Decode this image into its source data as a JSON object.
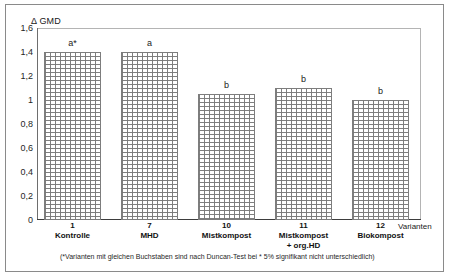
{
  "chart_data": {
    "type": "bar",
    "title": "",
    "ylabel": "Δ GMD",
    "xlabel": "Varianten",
    "ylim": [
      0,
      1.6
    ],
    "grid": false,
    "legend": "none",
    "ytick_labels": [
      "1,6",
      "1,4",
      "1,2",
      "1",
      "0,8",
      "0,6",
      "0,4",
      "0,2",
      "0"
    ],
    "ytick_values": [
      1.6,
      1.4,
      1.2,
      1.0,
      0.8,
      0.6,
      0.4,
      0.2,
      0
    ],
    "categories": [
      "Kontrolle",
      "MHD",
      "Mistkompost",
      "Mistkompost + org.HD",
      "Biokompost"
    ],
    "variant_numbers": [
      "1",
      "7",
      "10",
      "11",
      "12"
    ],
    "values": [
      1.4,
      1.4,
      1.05,
      1.1,
      1.0
    ],
    "annotations": [
      "a*",
      "a",
      "b",
      "b",
      "b"
    ],
    "bars": [
      {
        "number": "1",
        "name_line1": "Kontrolle",
        "name_line2": "",
        "value": 1.4,
        "letter": "a*"
      },
      {
        "number": "7",
        "name_line1": "MHD",
        "name_line2": "",
        "value": 1.4,
        "letter": "a"
      },
      {
        "number": "10",
        "name_line1": "Mistkompost",
        "name_line2": "",
        "value": 1.05,
        "letter": "b"
      },
      {
        "number": "11",
        "name_line1": "Mistkompost",
        "name_line2": "+ org.HD",
        "value": 1.1,
        "letter": "b"
      },
      {
        "number": "12",
        "name_line1": "Biokompost",
        "name_line2": "",
        "value": 1.0,
        "letter": "b"
      }
    ],
    "footnote": "(*Varianten mit gleichen Buchstaben sind nach Duncan-Test bei * 5% signifikant nicht unterschiedlich)",
    "colors": {
      "bar_fill": "#ffffff",
      "bar_hatch": "#787878",
      "bar_border": "#7d7d7d",
      "axis": "#3d3d3d",
      "frame": "#8a8a8a",
      "text": "#1a1a1a"
    }
  }
}
